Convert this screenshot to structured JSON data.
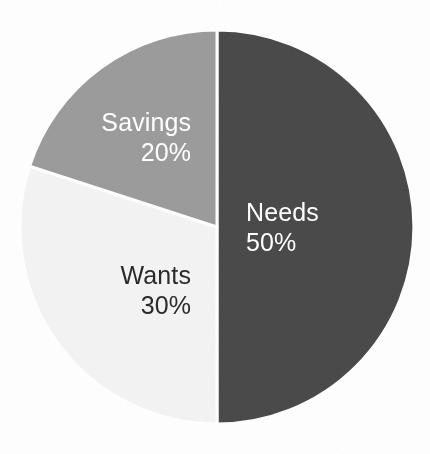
{
  "chart_data": {
    "type": "pie",
    "title": "",
    "subtitle": "",
    "xlabel": "",
    "ylabel": "",
    "legend_position": "none",
    "grid": false,
    "label_format": "name + percent",
    "start_angle_deg": 0,
    "direction": "clockwise",
    "categories": [
      "Needs",
      "Wants",
      "Savings"
    ],
    "values": [
      50,
      30,
      20
    ],
    "unit": "%",
    "slices": [
      {
        "name": "Needs",
        "value": 50,
        "percent_label": "50%",
        "color": "#4a4a4a",
        "label_color": "#ffffff",
        "start_angle_deg": 0,
        "end_angle_deg": 180
      },
      {
        "name": "Wants",
        "value": 30,
        "percent_label": "30%",
        "color": "#f4f4f4",
        "label_color": "#2b2b2b",
        "start_angle_deg": 180,
        "end_angle_deg": 288
      },
      {
        "name": "Savings",
        "value": 20,
        "percent_label": "20%",
        "color": "#9c9c9c",
        "label_color": "#ffffff",
        "start_angle_deg": 288,
        "end_angle_deg": 360
      }
    ]
  },
  "figure": {
    "background_color": "#ffffff",
    "separator_color": "#ffffff",
    "center_x": 217,
    "center_y": 227,
    "radius": 197
  },
  "labels": {
    "needs": {
      "name": "Needs",
      "value": "50%"
    },
    "wants": {
      "name": "Wants",
      "value": "30%"
    },
    "savings": {
      "name": "Savings",
      "value": "20%"
    }
  }
}
